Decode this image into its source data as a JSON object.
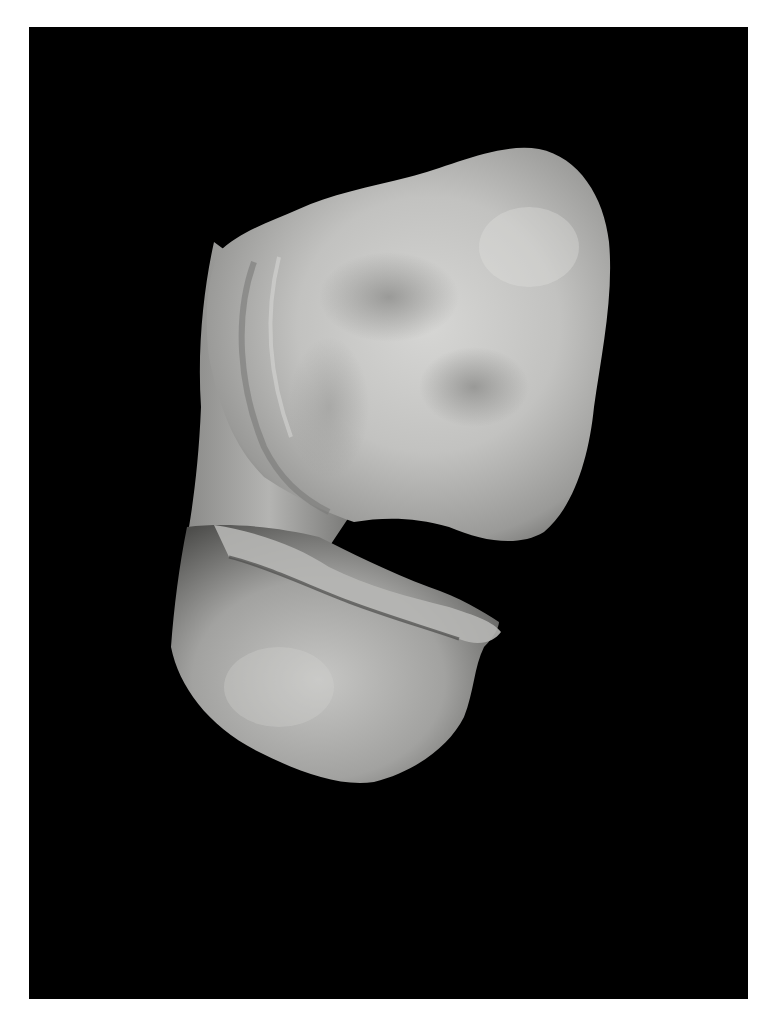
{
  "image": {
    "subject": "clay sculpture",
    "description": "Photograph of a grey hand-modelled clay form on a black background",
    "colors": {
      "page_background": "#ffffff",
      "photo_background": "#000000",
      "clay_light": "#d8d8d6",
      "clay_mid": "#a9a9a7",
      "clay_dark": "#5e5e5c"
    }
  }
}
